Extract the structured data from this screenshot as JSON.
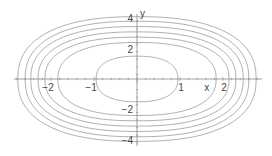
{
  "chart_data": {
    "type": "line",
    "title": "",
    "subtitle": "",
    "xlabel": "x",
    "ylabel": "y",
    "xlim": [
      -3,
      3
    ],
    "ylim": [
      -4.2,
      4.2
    ],
    "grid": false,
    "legend": null,
    "x_ticks": [
      -2,
      -1,
      1,
      2
    ],
    "y_ticks": [
      -4,
      -2,
      2,
      4
    ],
    "x_tick_labels": [
      "−2",
      "−1",
      "1",
      "2"
    ],
    "y_tick_labels": [
      "−4",
      "−2",
      "2",
      "4"
    ],
    "series": [
      {
        "name": "curve-1",
        "x_semi_axis": 0.95,
        "y_semi_axis": 1.5
      },
      {
        "name": "curve-2",
        "x_semi_axis": 1.84,
        "y_semi_axis": 2.4
      },
      {
        "name": "curve-3",
        "x_semi_axis": 2.14,
        "y_semi_axis": 2.75
      },
      {
        "name": "curve-4",
        "x_semi_axis": 2.3,
        "y_semi_axis": 3.1
      },
      {
        "name": "curve-5",
        "x_semi_axis": 2.47,
        "y_semi_axis": 3.45
      },
      {
        "name": "curve-6",
        "x_semi_axis": 2.6,
        "y_semi_axis": 3.8
      },
      {
        "name": "curve-7",
        "x_semi_axis": 2.77,
        "y_semi_axis": 4.1
      }
    ],
    "colors": {
      "curve": "#9a9a9a",
      "axis": "#888888",
      "text": "#444444"
    }
  },
  "layout": {
    "origin_px": [
      137,
      79
    ],
    "x_px_per_unit": 43,
    "y_px_per_unit": 15.2,
    "x_axis_extent_px": [
      14,
      262
    ],
    "y_axis_extent_px": [
      14,
      146
    ],
    "exponent": 2.4
  }
}
